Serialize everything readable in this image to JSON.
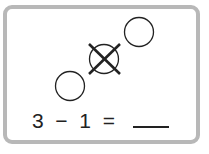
{
  "problem": {
    "objects": [
      {
        "shape": "circle",
        "crossed_out": false
      },
      {
        "shape": "circle",
        "crossed_out": true
      },
      {
        "shape": "circle",
        "crossed_out": false
      }
    ],
    "equation": {
      "left": "3",
      "operator": "−",
      "right": "1",
      "equals": "=",
      "answer": ""
    }
  },
  "colors": {
    "stroke": "#222222",
    "border": "#b8b8b8"
  }
}
